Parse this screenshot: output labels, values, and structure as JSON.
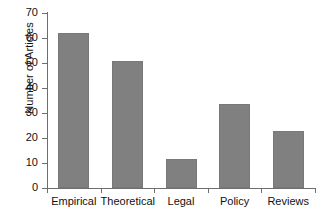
{
  "chart_data": {
    "type": "bar",
    "title": "",
    "xlabel": "",
    "ylabel": "Number of Articles",
    "categories": [
      "Empirical",
      "Theoretical",
      "Legal",
      "Policy",
      "Reviews"
    ],
    "values": [
      62,
      51,
      11.5,
      33.5,
      23
    ],
    "ylim": [
      0,
      70
    ],
    "ytick_step": 10,
    "yticks": [
      0,
      10,
      20,
      30,
      40,
      50,
      60,
      70
    ],
    "ytick_labels": [
      "0",
      "10",
      "20",
      "30",
      "40",
      "50",
      "60",
      "70"
    ],
    "grid": false,
    "legend": false,
    "legend_position": "none",
    "bar_color": "#808080",
    "bar_edge_color": "#787878",
    "axis_color": "#6e6e6e",
    "background_color": "#ffffff"
  }
}
